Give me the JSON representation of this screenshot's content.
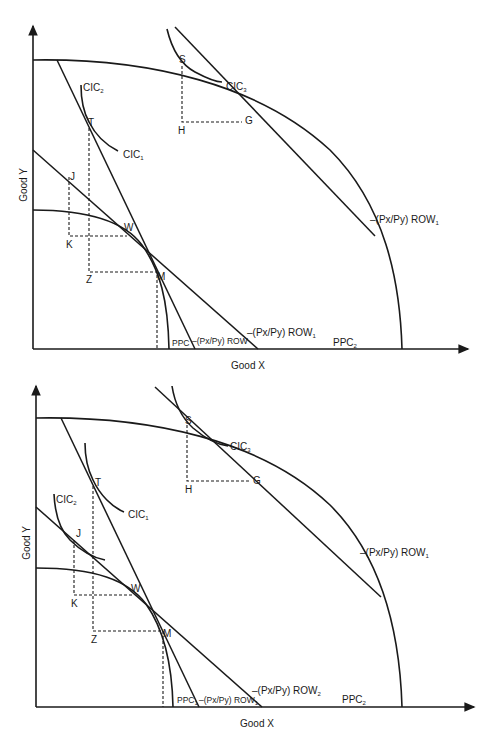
{
  "diagrams": [
    {
      "id": "top",
      "axes": {
        "x_label": "Good X",
        "y_label": "Good Y"
      },
      "points": {
        "S": "S",
        "G": "G",
        "H": "H",
        "T": "T",
        "J": "J",
        "K": "K",
        "W": "W",
        "M": "M",
        "Z": "Z"
      },
      "curves": {
        "cic2": "CIC",
        "cic2_sub": "2",
        "cic1": "CIC",
        "cic1_sub": "1",
        "cic3": "CIC",
        "cic3_sub": "3",
        "ppc1": "PPC",
        "ppc1_sub": "",
        "ppc2": "PPC",
        "ppc2_sub": "2",
        "row_steep": "–(Px/Py) ROW",
        "row_steep_sub": "",
        "row_mid": "–(Px/Py) ROW",
        "row_mid_sub": "1",
        "row_top": "–(Px/Py) ROW",
        "row_top_sub": "1"
      }
    },
    {
      "id": "bottom",
      "axes": {
        "x_label": "Good X",
        "y_label": "Good Y"
      },
      "points": {
        "S": "S",
        "G": "G",
        "H": "H",
        "T": "T",
        "J": "J",
        "K": "K",
        "W": "W",
        "M": "M",
        "Z": "Z"
      },
      "curves": {
        "cic2": "CIC",
        "cic2_sub": "2",
        "cic1": "CIC",
        "cic1_sub": "1",
        "cic3": "CIC",
        "cic3_sub": "3",
        "ppc1": "PPC",
        "ppc1_sub": "1",
        "ppc2": "PPC",
        "ppc2_sub": "2",
        "row_steep": "–(Px/Py) ROW",
        "row_steep_sub": "1",
        "row_mid": "–(Px/Py) ROW",
        "row_mid_sub": "2",
        "row_top": "–(Px/Py) ROW",
        "row_top_sub": "1"
      }
    }
  ]
}
